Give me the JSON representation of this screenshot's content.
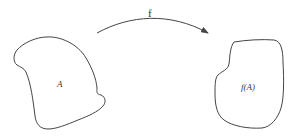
{
  "diagram": {
    "type": "function-mapping",
    "domain_set": {
      "label": "A"
    },
    "image_set": {
      "label": "f(A)"
    },
    "arrow": {
      "label": "f",
      "direction": "left-to-right"
    },
    "colors": {
      "stroke": "#444444",
      "text": "#333333",
      "background": "#ffffff"
    }
  }
}
